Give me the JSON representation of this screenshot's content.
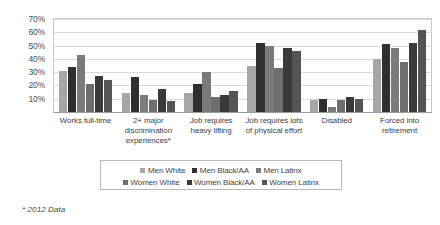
{
  "chart_data": {
    "type": "bar",
    "title": "",
    "subtitle": "",
    "xlabel": "",
    "ylabel": "",
    "ylim": [
      0,
      70
    ],
    "ytick_labels": [
      "10%",
      "20%",
      "30%",
      "40%",
      "50%",
      "60%",
      "70%"
    ],
    "ytick_values": [
      10,
      20,
      30,
      40,
      50,
      60,
      70
    ],
    "grid": true,
    "legend_position": "bottom",
    "categories": [
      "Works full-time",
      "2+ major discrimination experiences*",
      "Job requires heavy lifting",
      "Job requires lots of physical effort",
      "Disabled",
      "Forced into retirement"
    ],
    "series": [
      {
        "name": "Men White",
        "color": "#a6a6a6",
        "values": [
          31,
          14,
          14,
          35,
          9,
          40
        ]
      },
      {
        "name": "Men Black/AA",
        "color": "#2f2f2f",
        "values": [
          34,
          26,
          21,
          52,
          10,
          51
        ]
      },
      {
        "name": "Men Latinx",
        "color": "#7b7b7b",
        "values": [
          43,
          13,
          30,
          50,
          4,
          48
        ]
      },
      {
        "name": "Women White",
        "color": "#6e6e6e",
        "values": [
          21,
          9,
          11,
          33,
          9,
          38
        ]
      },
      {
        "name": "Women Black/AA",
        "color": "#3a3a3a",
        "values": [
          27,
          17,
          13,
          48,
          11,
          52
        ]
      },
      {
        "name": "Women Latinx",
        "color": "#555555",
        "values": [
          24,
          8,
          16,
          46,
          10,
          62
        ]
      }
    ],
    "annotations": [
      "* 2012 Data"
    ]
  },
  "axis": {
    "y_ticks": [
      {
        "label": "70%",
        "value": 70
      },
      {
        "label": "60%",
        "value": 60
      },
      {
        "label": "50%",
        "value": 50
      },
      {
        "label": "40%",
        "value": 40
      },
      {
        "label": "30%",
        "value": 30
      },
      {
        "label": "20%",
        "value": 20
      },
      {
        "label": "10%",
        "value": 10
      }
    ]
  },
  "categories": [
    {
      "label": "Works full-time"
    },
    {
      "label": "2+ major discrimination experiences*"
    },
    {
      "label": "Job requires heavy lifting"
    },
    {
      "label": "Job requires lots of physical effort"
    },
    {
      "label": "Disabled"
    },
    {
      "label": "Forced into retirement"
    }
  ],
  "legend": {
    "row1": [
      {
        "label": "Men White",
        "color": "#a6a6a6"
      },
      {
        "label": "Men Black/AA",
        "color": "#2f2f2f"
      },
      {
        "label": "Men Latinx",
        "color": "#7b7b7b"
      }
    ],
    "row2": [
      {
        "label": "Women White",
        "color": "#6e6e6e"
      },
      {
        "label": "Women Black/AA",
        "color": "#3a3a3a"
      },
      {
        "label": "Women Latinx",
        "color": "#555555"
      }
    ]
  },
  "footnote": {
    "text": "* 2012 Data"
  }
}
